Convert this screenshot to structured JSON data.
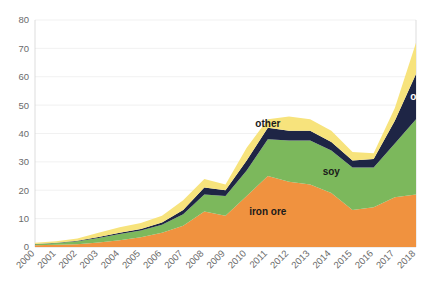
{
  "chart_data": {
    "type": "area",
    "stacked": true,
    "title": "",
    "subtitle": "",
    "xlabel": "",
    "ylabel": "",
    "xlim": [
      2000,
      2018
    ],
    "ylim": [
      0,
      80
    ],
    "ytick_values": [
      0,
      10,
      20,
      30,
      40,
      50,
      60,
      70,
      80
    ],
    "ytick_labels": [
      "0",
      "10",
      "20",
      "30",
      "40",
      "50",
      "60",
      "70",
      "80"
    ],
    "grid": true,
    "legend_position": "inline-annotations",
    "categories": [
      "2000",
      "2001",
      "2002",
      "2003",
      "2004",
      "2005",
      "2006",
      "2007",
      "2008",
      "2009",
      "2010",
      "2011",
      "2012",
      "2013",
      "2014",
      "2015",
      "2016",
      "2017",
      "2018"
    ],
    "series": [
      {
        "name": "iron ore",
        "color": "#F0923F",
        "label_text": "iron ore",
        "values": [
          0.6,
          0.8,
          1.0,
          1.6,
          2.4,
          3.4,
          5.0,
          7.5,
          12.5,
          11.0,
          18.0,
          25.0,
          23.0,
          22.0,
          19.0,
          13.0,
          14.0,
          17.5,
          18.5
        ]
      },
      {
        "name": "soy",
        "color": "#7CB85C",
        "label_text": "soy",
        "values": [
          0.4,
          0.6,
          1.0,
          1.6,
          2.2,
          2.4,
          2.8,
          4.0,
          6.0,
          7.0,
          9.0,
          13.0,
          14.5,
          15.5,
          15.0,
          15.0,
          14.0,
          19.0,
          26.5
        ]
      },
      {
        "name": "oil",
        "color": "#1E2545",
        "label_text": "oil",
        "values": [
          0.1,
          0.1,
          0.2,
          0.3,
          0.4,
          0.5,
          0.8,
          1.5,
          2.5,
          2.0,
          3.5,
          4.0,
          3.5,
          3.5,
          3.0,
          2.5,
          3.0,
          8.0,
          16.0
        ]
      },
      {
        "name": "other",
        "color": "#F7E37C",
        "label_text": "other",
        "values": [
          0.4,
          0.5,
          0.8,
          1.5,
          2.0,
          2.2,
          2.4,
          3.5,
          3.0,
          2.0,
          4.5,
          3.0,
          5.0,
          4.0,
          4.0,
          3.0,
          2.0,
          4.5,
          11.0
        ]
      }
    ],
    "totals": [
      1.5,
      2.0,
      3.0,
      5.0,
      7.0,
      8.5,
      11.0,
      16.5,
      24.0,
      22.0,
      35.0,
      45.0,
      46.0,
      45.0,
      41.0,
      33.5,
      33.0,
      49.0,
      72.0
    ],
    "annotations": [
      {
        "text": "other",
        "series": "other",
        "x_year": 2011,
        "on_dark": false
      },
      {
        "text": "oil",
        "series": "oil",
        "x_year": 2018,
        "on_dark": true
      },
      {
        "text": "soy",
        "series": "soy",
        "x_year": 2014,
        "on_dark": false
      },
      {
        "text": "iron ore",
        "series": "iron ore",
        "x_year": 2011,
        "on_dark": false
      }
    ]
  },
  "colors": {
    "iron_ore": "#F0923F",
    "soy": "#7CB85C",
    "oil": "#1E2545",
    "other": "#F7E37C",
    "grid": "#e8e8e8",
    "axis_text": "#6b6b6b",
    "background": "#ffffff"
  }
}
